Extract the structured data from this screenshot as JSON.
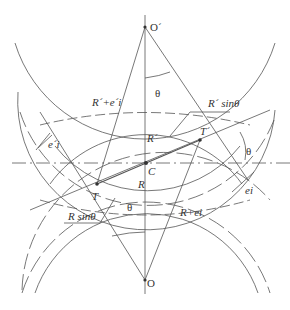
{
  "labels": {
    "o_prime": "O´",
    "o": "O",
    "theta_top": "θ",
    "theta_bottom": "θ",
    "theta_right": "θ",
    "r_prime_plus": "R´+e´i",
    "r_prime_sin": "R´ sinθ",
    "r_prime": "R´",
    "t_prime": "T´",
    "c": "C",
    "e_prime_i": "e´i",
    "r": "R",
    "t": "T",
    "ei": "ei",
    "r_sin": "R sinθ",
    "r_plus": "R+ei"
  },
  "colors": {
    "line": "#555555",
    "text": "#333333"
  }
}
